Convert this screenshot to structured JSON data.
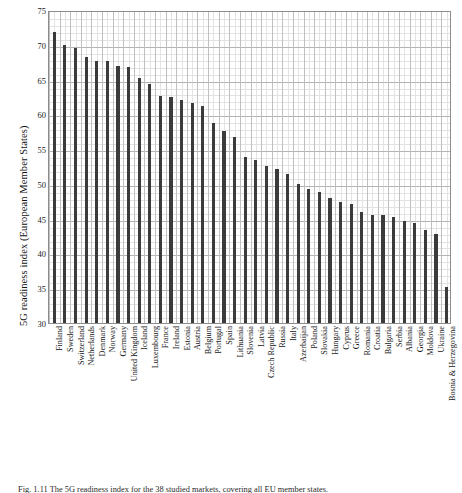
{
  "chart_data": {
    "type": "bar",
    "title": "",
    "xlabel": "",
    "ylabel": "5G readiness index (European Member States)",
    "ylim": [
      30,
      75
    ],
    "ytick_labels": [
      "75",
      "70",
      "65",
      "60",
      "55",
      "50",
      "45",
      "40",
      "35",
      "30"
    ],
    "ytick_values": [
      75,
      70,
      65,
      60,
      55,
      50,
      45,
      40,
      35,
      30
    ],
    "ytick_minor_step": 1,
    "grid": true,
    "legend": "none",
    "bar_color": "#3b3b3b",
    "categories": [
      "Finland",
      "Sweden",
      "Switzerland",
      "Netherlands",
      "Denmark",
      "Norway",
      "Germany",
      "United Kingdom",
      "Iceland",
      "Luxembourg",
      "France",
      "Ireland",
      "Estonia",
      "Austria",
      "Belgium",
      "Portugal",
      "Spain",
      "Lithuania",
      "Slovenia",
      "Latvia",
      "Czech Republic",
      "Russia",
      "Italy",
      "Azerbaijan",
      "Poland",
      "Slovakia",
      "Hungary",
      "Cyprus",
      "Greece",
      "Romania",
      "Croatia",
      "Bulgaria",
      "Serbia",
      "Albania",
      "Georgia",
      "Moldova",
      "Ukraine",
      "Bosnia & Herzegovina"
    ],
    "values": [
      71.8,
      69.9,
      69.6,
      68.2,
      67.7,
      67.7,
      66.9,
      66.8,
      65.2,
      64.4,
      62.7,
      62.5,
      62.0,
      61.6,
      61.2,
      58.8,
      57.6,
      56.8,
      53.8,
      53.4,
      52.6,
      52.2,
      51.4,
      50.0,
      49.2,
      48.8,
      48.0,
      47.4,
      47.1,
      46.0,
      45.6,
      45.5,
      45.2,
      44.6,
      44.4,
      43.4,
      42.8,
      35.2
    ]
  },
  "caption": {
    "text": "Fig. 1.11  The 5G readiness index for the 38 studied markets, covering all EU member states."
  },
  "ghost_text": {
    "line1": "a digital infrastructure",
    "line2": "comparison of 5G networks",
    "line3": "nationwide spectrum",
    "line4": "5G readiness index",
    "line5": "the main findings and"
  }
}
